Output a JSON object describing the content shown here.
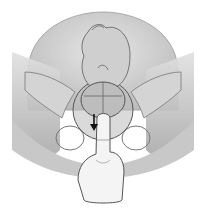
{
  "figure": {
    "description": "Grayscale medical illustration: fetus in breech/occiput position within a transparent uterus above the pelvis; a hand inserts two fingers from below; an arrow indicates downward motion.",
    "colors": {
      "background": "#ffffff",
      "uterus_fill": "#d9d9d9",
      "pelvis_fill": "#c4c4c4",
      "skin_fill": "#f2f2f2",
      "outline": "#555555",
      "arrow": "#111111"
    },
    "elements": [
      "uterus",
      "fetus",
      "fetal-head",
      "pelvis",
      "hand",
      "arrow"
    ]
  }
}
